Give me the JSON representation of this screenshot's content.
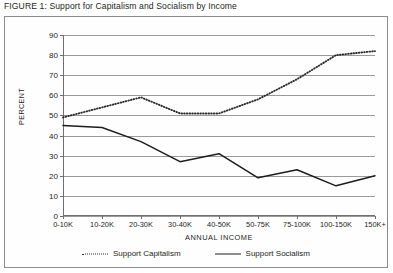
{
  "figure": {
    "caption": "FIGURE 1: Support for Capitalism and Socialism by Income"
  },
  "legend": {
    "position": "bottom-center",
    "entries": [
      {
        "label": "Support Capitalism",
        "style": "dotted",
        "color": "#2a2a2a",
        "icon": "dotted-line-icon"
      },
      {
        "label": "Support Socialism",
        "style": "solid",
        "color": "#1d1d1d",
        "icon": "solid-line-icon"
      }
    ]
  },
  "chart_data": {
    "type": "line",
    "title": "FIGURE 1: Support for Capitalism and Socialism by Income",
    "xlabel": "ANNUAL INCOME",
    "ylabel": "PERCENT",
    "categories": [
      "0-10K",
      "10-20K",
      "20-30K",
      "30-40K",
      "40-50K",
      "50-75K",
      "75-100K",
      "100-150K",
      "150K+"
    ],
    "ylim": [
      0,
      90
    ],
    "yticks": [
      0,
      10,
      20,
      30,
      40,
      50,
      60,
      70,
      80,
      90
    ],
    "grid": true,
    "series": [
      {
        "name": "Support Capitalism",
        "style": "dotted",
        "color": "#2a2a2a",
        "values": [
          49,
          54,
          59,
          51,
          51,
          58,
          68,
          80,
          82
        ]
      },
      {
        "name": "Support Socialism",
        "style": "solid",
        "color": "#1d1d1d",
        "values": [
          45,
          44,
          37,
          27,
          31,
          19,
          23,
          15,
          20
        ]
      }
    ]
  }
}
